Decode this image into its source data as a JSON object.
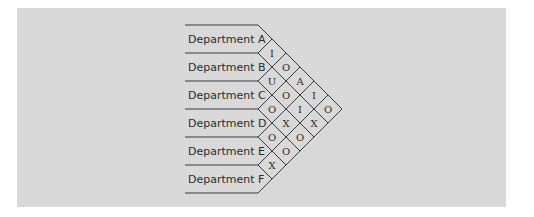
{
  "departments": [
    "Department A",
    "Department B",
    "Department C",
    "Department D",
    "Department E",
    "Department F"
  ],
  "relationships": [
    {
      "from": "Department A",
      "to": "Department B",
      "code": "I"
    },
    {
      "from": "Department A",
      "to": "Department C",
      "code": "O"
    },
    {
      "from": "Department A",
      "to": "Department D",
      "code": "A"
    },
    {
      "from": "Department A",
      "to": "Department E",
      "code": "I"
    },
    {
      "from": "Department A",
      "to": "Department F",
      "code": "O"
    },
    {
      "from": "Department B",
      "to": "Department C",
      "code": "U"
    },
    {
      "from": "Department B",
      "to": "Department D",
      "code": "O"
    },
    {
      "from": "Department B",
      "to": "Department E",
      "code": "I"
    },
    {
      "from": "Department B",
      "to": "Department F",
      "code": "X"
    },
    {
      "from": "Department C",
      "to": "Department D",
      "code": "O"
    },
    {
      "from": "Department C",
      "to": "Department E",
      "code": "X"
    },
    {
      "from": "Department C",
      "to": "Department F",
      "code": "O"
    },
    {
      "from": "Department D",
      "to": "Department E",
      "code": "O"
    },
    {
      "from": "Department D",
      "to": "Department F",
      "code": "O"
    },
    {
      "from": "Department E",
      "to": "Department F",
      "code": "X"
    }
  ],
  "colors": {
    "panel": "#d9d9d9",
    "line": "#3a3a3a",
    "text": "#2b2b2b"
  }
}
